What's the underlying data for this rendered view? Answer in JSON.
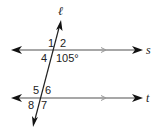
{
  "diagram": {
    "transversal_label": "ℓ",
    "line_s_label": "s",
    "line_t_label": "t",
    "angles": {
      "a1": "1",
      "a2": "2",
      "a4": "4",
      "a3_value": "105°",
      "a5": "5",
      "a6": "6",
      "a8": "8",
      "a7": "7"
    },
    "colors": {
      "line": "#8a8a8a",
      "arrow": "#111111",
      "text": "#222222"
    }
  }
}
